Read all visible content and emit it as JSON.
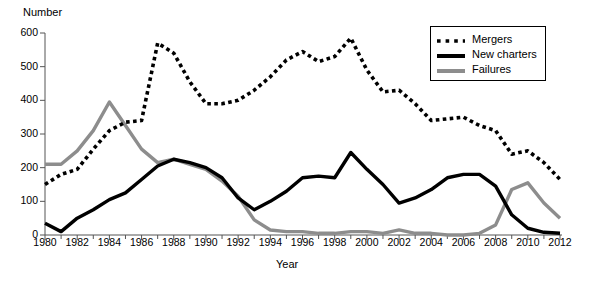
{
  "chart_data": {
    "type": "line",
    "title": "",
    "xlabel": "Year",
    "ylabel": "Number",
    "xlim": [
      1980,
      2012
    ],
    "ylim": [
      0,
      600
    ],
    "grid": false,
    "legend_position": "top-right",
    "x": [
      1980,
      1981,
      1982,
      1983,
      1984,
      1985,
      1986,
      1987,
      1988,
      1989,
      1990,
      1991,
      1992,
      1993,
      1994,
      1995,
      1996,
      1997,
      1998,
      1999,
      2000,
      2001,
      2002,
      2003,
      2004,
      2005,
      2006,
      2007,
      2008,
      2009,
      2010,
      2011,
      2012
    ],
    "xticks": [
      1980,
      1982,
      1984,
      1986,
      1988,
      1990,
      1992,
      1994,
      1996,
      1998,
      2000,
      2002,
      2004,
      2006,
      2008,
      2010,
      2012
    ],
    "xtick_labels": [
      "1980",
      "1982",
      "1984",
      "1986",
      "1988",
      "1990",
      "1992",
      "1994",
      "1996",
      "1998",
      "2000",
      "2002",
      "2004",
      "2006",
      "2008",
      "2010",
      "2012"
    ],
    "yticks": [
      0,
      100,
      200,
      300,
      400,
      500,
      600
    ],
    "ytick_labels": [
      "0",
      "100",
      "200",
      "300",
      "400",
      "500",
      "600"
    ],
    "series": [
      {
        "name": "Mergers",
        "style": "dotted",
        "color": "#000000",
        "values": [
          150,
          180,
          195,
          255,
          310,
          335,
          340,
          570,
          540,
          455,
          390,
          390,
          400,
          430,
          470,
          520,
          545,
          515,
          530,
          585,
          490,
          425,
          430,
          390,
          340,
          345,
          350,
          325,
          310,
          240,
          250,
          215,
          165
        ]
      },
      {
        "name": "New charters",
        "style": "solid-thick",
        "color": "#000000",
        "values": [
          35,
          10,
          50,
          75,
          105,
          125,
          165,
          205,
          225,
          215,
          200,
          170,
          110,
          75,
          100,
          130,
          170,
          175,
          170,
          245,
          195,
          150,
          95,
          110,
          135,
          170,
          180,
          180,
          145,
          60,
          20,
          8,
          5
        ]
      },
      {
        "name": "Failures",
        "style": "solid-gray",
        "color": "#8d8d8d",
        "values": [
          210,
          210,
          250,
          310,
          395,
          325,
          255,
          215,
          225,
          210,
          195,
          160,
          115,
          45,
          15,
          10,
          10,
          5,
          5,
          10,
          10,
          5,
          15,
          5,
          5,
          0,
          0,
          5,
          30,
          135,
          155,
          95,
          50
        ]
      }
    ]
  },
  "legend": {
    "items": [
      {
        "label": "Mergers",
        "style": "dotted"
      },
      {
        "label": "New charters",
        "style": "solid-thick"
      },
      {
        "label": "Failures",
        "style": "solid-gray"
      }
    ]
  }
}
